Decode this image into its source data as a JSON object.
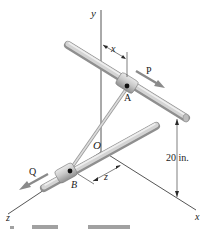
{
  "figure": {
    "axes": {
      "x_label": "x",
      "y_label": "y",
      "z_label": "z",
      "origin_label": "O"
    },
    "collars": {
      "a_label": "A",
      "b_label": "B"
    },
    "forces": {
      "p_label": "P",
      "q_label": "Q"
    },
    "dimensions": {
      "x_dim": "x",
      "z_dim": "z",
      "height": "20 in."
    },
    "colors": {
      "rod": "#c8c8c8",
      "rod_dark": "#8e8e8e",
      "line": "#2a2a2a",
      "force_arrow": "#8a8a8a",
      "pin": "#111111"
    },
    "caption_truncated": "(text cut off at bottom edge)"
  }
}
